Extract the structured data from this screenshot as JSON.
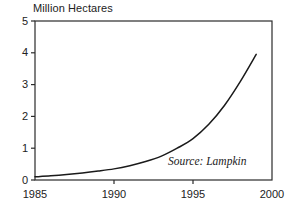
{
  "chart_data": {
    "type": "line",
    "title": "Million Hectares",
    "xlabel": "",
    "ylabel": "Million Hectares",
    "xlim": [
      1985,
      2000
    ],
    "ylim": [
      0,
      5
    ],
    "grid": false,
    "legend": null,
    "annotations": [
      {
        "name": "source-note",
        "text": "Source: Lampkin"
      }
    ],
    "x_ticks": [
      1985,
      1990,
      1995,
      2000
    ],
    "x_tick_labels": [
      "1985",
      "1990",
      "1995",
      "2000"
    ],
    "y_ticks": [
      0,
      1,
      2,
      3,
      4,
      5
    ],
    "y_tick_labels": [
      "0",
      "1",
      "2",
      "3",
      "4",
      "5"
    ],
    "series": [
      {
        "name": "Organic area",
        "color": "#1a1a1a",
        "x": [
          1985,
          1986,
          1987,
          1988,
          1989,
          1990,
          1991,
          1992,
          1993,
          1994,
          1995,
          1996,
          1997,
          1998,
          1999
        ],
        "values": [
          0.1,
          0.13,
          0.17,
          0.22,
          0.28,
          0.35,
          0.45,
          0.58,
          0.75,
          1.0,
          1.3,
          1.75,
          2.35,
          3.1,
          3.95
        ]
      }
    ]
  },
  "axis_title": "Million Hectares",
  "source": "Source: Lampkin",
  "colors": {
    "line": "#1a1a1a",
    "frame": "#2b2b2b",
    "text": "#222222",
    "background": "#ffffff"
  }
}
